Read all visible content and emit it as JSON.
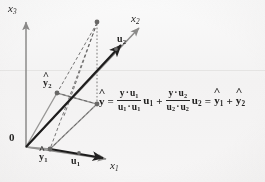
{
  "figure": {
    "kind": "orthogonal-projection-3d-diagram",
    "background_color": "#f6f4f2",
    "ink_color": "#2a2724",
    "axis_color": "#9a9691",
    "dashed_color": "#6f6b67",
    "vector_color": "#1f1c1a"
  },
  "axes": [
    {
      "id": "x3",
      "label": "x",
      "sub": "3",
      "label_x": 8,
      "label_y": 4,
      "from": [
        26,
        146
      ],
      "to": [
        26,
        22
      ]
    },
    {
      "id": "x2",
      "label": "x",
      "sub": "2",
      "label_x": 131,
      "label_y": 14,
      "from": [
        26,
        146
      ],
      "to": [
        143,
        24
      ]
    },
    {
      "id": "x1",
      "label": "x",
      "sub": "1",
      "label_x": 113,
      "label_y": 162,
      "from": [
        26,
        146
      ],
      "to": [
        109,
        160
      ]
    }
  ],
  "origin": {
    "label": "0",
    "x": 9,
    "y": 133
  },
  "points": [
    {
      "id": "y",
      "label": "",
      "x": 97,
      "y": 22,
      "marker": true
    },
    {
      "id": "yhat",
      "label": "ŷ",
      "x": 97,
      "y": 104,
      "marker": true
    },
    {
      "id": "yhat1",
      "label": "ŷ",
      "sub": "1",
      "x": 50,
      "y": 148,
      "marker": true,
      "label_x": 40,
      "label_y": 152
    },
    {
      "id": "yhat2",
      "label": "ŷ",
      "sub": "2",
      "x": 57,
      "y": 93,
      "marker": true,
      "label_x": 44,
      "label_y": 78
    }
  ],
  "vectors": [
    {
      "id": "u1",
      "label": "u",
      "sub": "1",
      "tip": [
        78,
        152
      ],
      "label_x": 71,
      "label_y": 155
    },
    {
      "id": "u2",
      "label": "u",
      "sub": "2",
      "tip": [
        116,
        49
      ],
      "label_x": 117,
      "label_y": 35
    }
  ],
  "yhat_label": {
    "text": "ŷ",
    "x": 99,
    "y": 99
  },
  "formula": {
    "lhs": "ŷ",
    "equals": "=",
    "term1": {
      "numerator": {
        "a": "y",
        "dot": "·",
        "b": "u",
        "b_sub": "1"
      },
      "denominator": {
        "a": "u",
        "a_sub": "1",
        "dot": "·",
        "b": "u",
        "b_sub": "1"
      },
      "multiplier": {
        "v": "u",
        "sub": "1"
      }
    },
    "plus": "+",
    "term2": {
      "numerator": {
        "a": "y",
        "dot": "·",
        "b": "u",
        "b_sub": "2"
      },
      "denominator": {
        "a": "u",
        "a_sub": "2",
        "dot": "·",
        "b": "u",
        "b_sub": "2"
      },
      "multiplier": {
        "v": "u",
        "sub": "2"
      }
    },
    "equals2": "=",
    "sum1": {
      "v": "ŷ",
      "sub": "1"
    },
    "plus2": "+",
    "sum2": {
      "v": "ŷ",
      "sub": "2"
    }
  }
}
